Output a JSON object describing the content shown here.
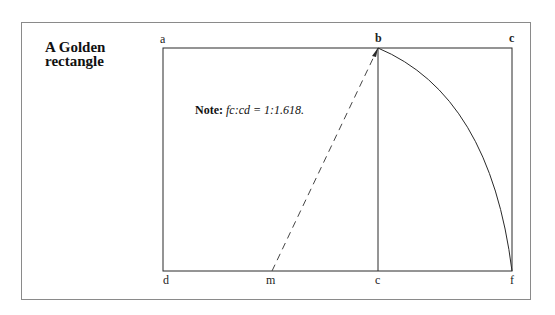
{
  "figure": {
    "title_line1": "A Golden",
    "title_line2": "rectangle",
    "note_label": "Note:",
    "note_formula": "fc:cd  =  1:1.618.",
    "points": {
      "a": "a",
      "b": "b",
      "c_top": "c",
      "d": "d",
      "m": "m",
      "c_bottom": "c",
      "f": "f"
    },
    "colors": {
      "line": "#2a2a2a",
      "frame": "#8a8a8a"
    }
  }
}
